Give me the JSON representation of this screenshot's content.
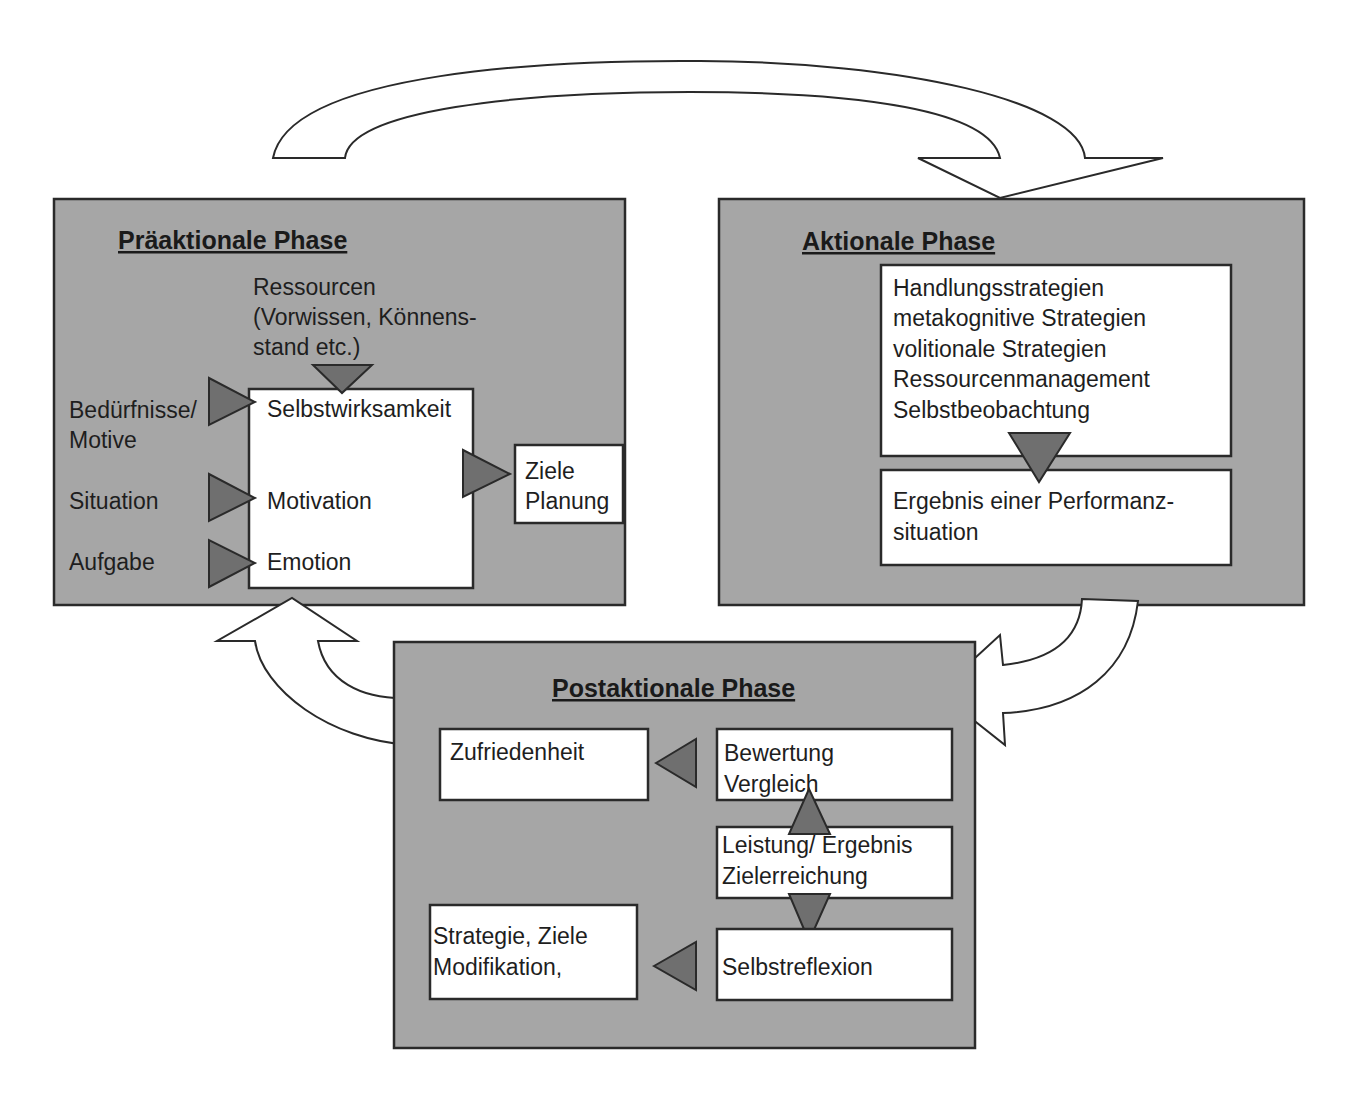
{
  "diagram": {
    "phases": {
      "pre": {
        "title": "Präaktionale Phase",
        "resources": [
          "Ressourcen",
          "(Vorwissen, Könnens-",
          "stand etc.)"
        ],
        "inputs": [
          "Bedürfnisse/",
          "Motive",
          "Situation",
          "Aufgabe"
        ],
        "core": [
          "Selbstwirksamkeit",
          "Motivation",
          "Emotion"
        ],
        "output": [
          "Ziele",
          "Planung"
        ]
      },
      "act": {
        "title": "Aktionale Phase",
        "strategies": [
          "Handlungsstrategien",
          "metakognitive Strategien",
          "volitionale Strategien",
          "Ressourcenmanagement",
          "Selbstbeobachtung"
        ],
        "result": [
          "Ergebnis einer Performanz-",
          "situation"
        ]
      },
      "post": {
        "title": "Postaktionale Phase",
        "satisfaction": [
          "Zufriedenheit"
        ],
        "evaluation": [
          "Bewertung",
          "Vergleich"
        ],
        "performance": [
          "Leistung/ Ergebnis",
          "Zielerreichung"
        ],
        "modification": [
          "Strategie, Ziele",
          "Modifikation,"
        ],
        "reflection": [
          "Selbstreflexion"
        ]
      }
    },
    "colors": {
      "panel": "#a6a6a6",
      "box": "#ffffff",
      "arrowhead": "#6f6f6f",
      "stroke": "#2a2a2a"
    }
  }
}
